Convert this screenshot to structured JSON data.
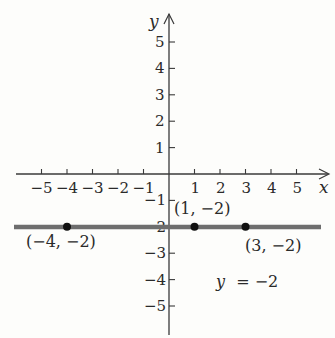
{
  "chart_data": {
    "type": "line",
    "title": "",
    "xlabel": "x",
    "ylabel": "y",
    "xlim": [
      -5.8,
      6.3
    ],
    "ylim": [
      -6,
      6
    ],
    "grid": false,
    "x_ticks": [
      -5,
      -4,
      -3,
      -2,
      -1,
      1,
      2,
      3,
      4,
      5
    ],
    "y_ticks": [
      -5,
      -4,
      -3,
      -2,
      -1,
      1,
      2,
      3,
      4,
      5
    ],
    "x_tick_labels": [
      "−5",
      "−4",
      "−3",
      "−2",
      "−1",
      "1",
      "2",
      "3",
      "4",
      "5"
    ],
    "y_tick_labels": [
      "−5",
      "−4",
      "−3",
      "−2",
      "−1",
      "1",
      "2",
      "3",
      "4",
      "5"
    ],
    "series": [
      {
        "name": "y = −2",
        "kind": "horizontal-line",
        "y": -2,
        "x_range": [
          -6,
          6
        ],
        "color": "#6e6e6e"
      }
    ],
    "points": [
      {
        "x": -4,
        "y": -2,
        "label": "(−4, −2)"
      },
      {
        "x": 1,
        "y": -2,
        "label": "(1, −2)"
      },
      {
        "x": 3,
        "y": -2,
        "label": "(3, −2)"
      }
    ],
    "annotations": [
      {
        "text": "y = −2",
        "x": 2.6,
        "y": -4
      }
    ]
  },
  "labels": {
    "x_axis": "x",
    "y_axis": "y",
    "equation_lhs": "y",
    "equation_rhs": "= −2",
    "point_a": "(−4, −2)",
    "point_b": "(1, −2)",
    "point_c": "(3, −2)"
  },
  "colors": {
    "axis": "#3a3a3a",
    "line": "#6e6e6e",
    "point": "#111111",
    "background": "#fdfdfb"
  }
}
